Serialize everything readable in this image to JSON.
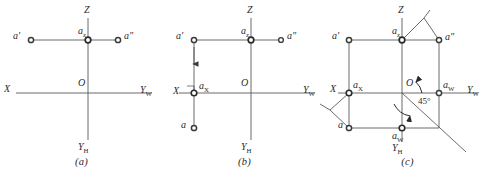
{
  "figure": {
    "background_color": "#ffffff",
    "stroke_color": "#5a5a5a",
    "text_color": "#2b2b2b",
    "panels": [
      {
        "id": "a",
        "caption": "(a)",
        "axis_labels": {
          "z": "Z",
          "x": "X",
          "y_w": "Y",
          "y_w_sub": "W",
          "y_h": "Y",
          "y_h_sub": "H",
          "origin": "O"
        },
        "point_labels": {
          "a_prime": "a'",
          "a_double_prime": "a\"",
          "a_z": "a",
          "a_z_sub": "z"
        }
      },
      {
        "id": "b",
        "caption": "(b)",
        "axis_labels": {
          "z": "Z",
          "x": "X",
          "y_w": "Y",
          "y_w_sub": "W",
          "y_h": "Y",
          "y_h_sub": "H",
          "origin": "O"
        },
        "point_labels": {
          "a_prime": "a'",
          "a_double_prime": "a\"",
          "a_z": "a",
          "a_z_sub": "z",
          "a_x": "a",
          "a_x_sub": "X",
          "a": "a"
        }
      },
      {
        "id": "c",
        "caption": "(c)",
        "axis_labels": {
          "z": "Z",
          "x": "X",
          "y_w": "Y",
          "y_w_sub": "W",
          "y_h": "Y",
          "y_h_sub": "H",
          "origin": "O"
        },
        "point_labels": {
          "a_prime": "a'",
          "a_double_prime": "a\"",
          "a_z": "a",
          "a_z_sub": "z",
          "a_x": "a",
          "a_x_sub": "X",
          "a": "a",
          "a_w_right": "a",
          "a_w_right_sub": "W",
          "a_w_bottom": "a",
          "a_w_bottom_sub": "W"
        },
        "annotations": {
          "angle": "45°"
        }
      }
    ]
  }
}
